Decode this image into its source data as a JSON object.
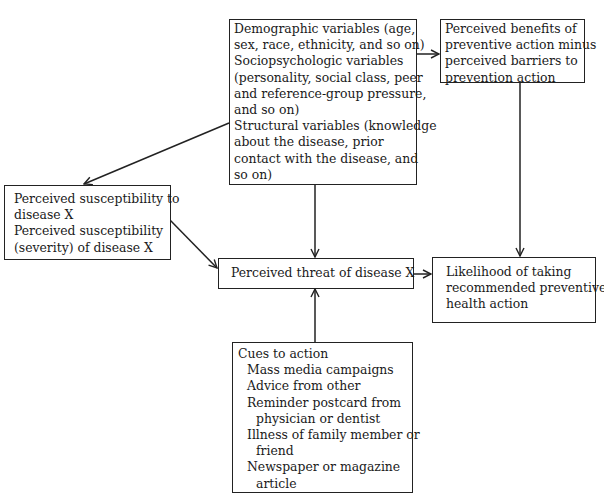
{
  "diagram": {
    "nodes": {
      "modifying_factors": {
        "lines": [
          "Demographic variables (age,",
          "sex, race, ethnicity, and so on)",
          "Sociopsychologic variables",
          "(personality, social class, peer",
          "and reference-group pressure,",
          "and so on)",
          "Structural variables (knowledge",
          "about the disease, prior",
          "contact with the disease, and",
          "so on)"
        ]
      },
      "benefits_barriers": {
        "lines": [
          "Perceived benefits of",
          "preventive action minus",
          "perceived barriers to",
          "prevention action"
        ]
      },
      "susceptibility": {
        "lines": [
          "Perceived susceptibility to",
          "disease X",
          "Perceived susceptibility",
          "(severity) of disease X"
        ]
      },
      "threat": {
        "lines": [
          "Perceived threat of disease X"
        ]
      },
      "likelihood": {
        "lines": [
          "Likelihood of taking",
          "recommended preventive",
          "health action"
        ]
      },
      "cues": {
        "heading": "Cues to action",
        "items": [
          "Mass media campaigns",
          "Advice from other",
          "Reminder postcard from",
          "physician or dentist",
          "Illness of family member or",
          "friend",
          "Newspaper or magazine",
          "article"
        ]
      }
    },
    "edges": [
      {
        "from": "modifying_factors",
        "to": "benefits_barriers"
      },
      {
        "from": "modifying_factors",
        "to": "susceptibility"
      },
      {
        "from": "modifying_factors",
        "to": "threat"
      },
      {
        "from": "susceptibility",
        "to": "threat"
      },
      {
        "from": "benefits_barriers",
        "to": "likelihood"
      },
      {
        "from": "threat",
        "to": "likelihood"
      },
      {
        "from": "cues",
        "to": "threat"
      }
    ],
    "colors": {
      "line": "#222222",
      "background": "#ffffff"
    }
  }
}
